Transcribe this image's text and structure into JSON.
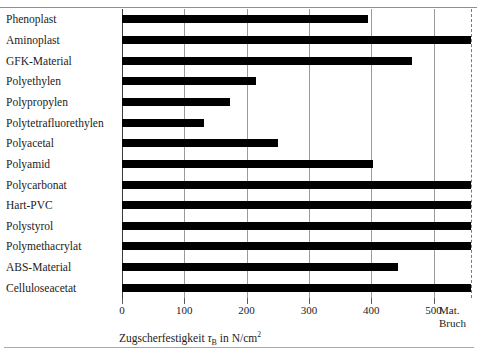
{
  "figure": {
    "caption_remnant": "",
    "axis_title_prefix": "Zugscherfestigkeit",
    "axis_title_symbol": "τ",
    "axis_title_subscript": "B",
    "axis_title_unit_prefix": "in N/cm",
    "axis_title_unit_sup": "2",
    "matbruch_line1": "Mat.",
    "matbruch_line2": "Bruch",
    "colors": {
      "bar": "#000000",
      "grid": "#9b9b9b",
      "axis": "#3a3a3a",
      "matbruch_dash": "#7a7a7a",
      "text": "#1c1c1c",
      "background": "#ffffff"
    }
  },
  "chart_data": {
    "type": "bar",
    "orientation": "horizontal",
    "title": "",
    "xlabel": "Zugscherfestigkeit τB in N/cm²",
    "ylabel": "",
    "xlim": [
      0,
      560
    ],
    "grid": true,
    "legend": null,
    "xticks": [
      0,
      100,
      200,
      300,
      400,
      500
    ],
    "xtick_labels": [
      "0",
      "100",
      "200",
      "300",
      "400",
      "500"
    ],
    "annotations": [
      "Mat. Bruch"
    ],
    "mat_bruch_value": 560,
    "categories": [
      "Phenoplast",
      "Aminoplast",
      "GFK-Material",
      "Polyethylen",
      "Polypropylen",
      "Polytetrafluorethylen",
      "Polyacetal",
      "Polyamid",
      "Polycarbonat",
      "Hart-PVC",
      "Polystyrol",
      "Polymethacrylat",
      "ABS-Material",
      "Celluloseacetat"
    ],
    "values": [
      394,
      560,
      466,
      215,
      174,
      131,
      251,
      402,
      560,
      560,
      560,
      560,
      442,
      560
    ],
    "value_is_mat_bruch": [
      false,
      true,
      false,
      false,
      false,
      false,
      false,
      false,
      true,
      true,
      true,
      true,
      false,
      true
    ]
  }
}
